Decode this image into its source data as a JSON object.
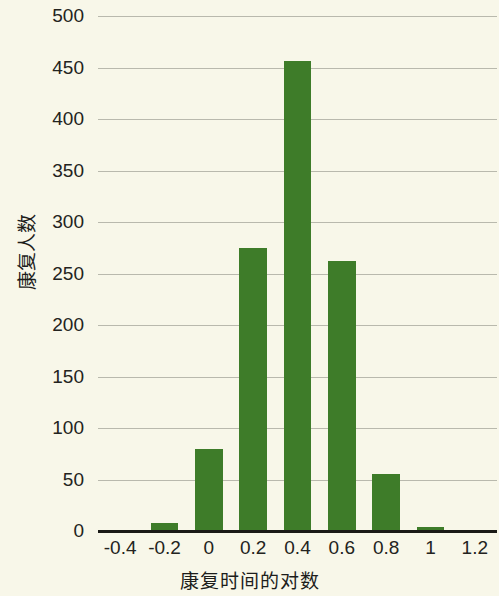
{
  "chart_data": {
    "type": "bar",
    "title": "",
    "subtitle": "",
    "xlabel": "康复时间的对数",
    "ylabel": "康复人数",
    "categories": [
      "-0.2",
      "0",
      "0.2",
      "0.4",
      "0.6",
      "0.8",
      "1"
    ],
    "values": [
      8,
      80,
      275,
      456,
      262,
      55,
      4
    ],
    "series": [
      {
        "name": "康复人数",
        "values": [
          8,
          80,
          275,
          456,
          262,
          55,
          4
        ]
      }
    ],
    "x": [
      -0.2,
      0,
      0.2,
      0.4,
      0.6,
      0.8,
      1
    ],
    "xlim": [
      -0.5,
      1.3
    ],
    "ylim": [
      0,
      500
    ],
    "x_ticks": [
      "-0.4",
      "-0.2",
      "0",
      "0.2",
      "0.4",
      "0.6",
      "0.8",
      "1",
      "1.2"
    ],
    "x_tick_values": [
      -0.4,
      -0.2,
      0,
      0.2,
      0.4,
      0.6,
      0.8,
      1,
      1.2
    ],
    "y_ticks": [
      "0",
      "50",
      "100",
      "150",
      "200",
      "250",
      "300",
      "350",
      "400",
      "450",
      "500"
    ],
    "y_tick_values": [
      0,
      50,
      100,
      150,
      200,
      250,
      300,
      350,
      400,
      450,
      500
    ],
    "grid": true,
    "grid_axis": "y",
    "legend": false,
    "legend_position": "none",
    "bar_color": "#3e7c29",
    "background_color": "#f8f7e9",
    "gridline_color": "#b9b9ad",
    "axis_color": "#1a1a16",
    "text_color": "#232320",
    "bar_width_fraction": 0.62
  }
}
